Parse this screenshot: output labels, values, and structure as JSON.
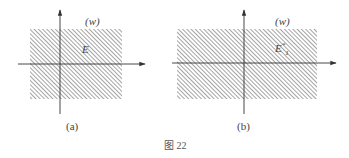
{
  "figure": {
    "caption": "图 22",
    "panels": [
      {
        "id": "a",
        "sublabel": "(a)",
        "plane_label": "(w)",
        "region_label": "E",
        "region": {
          "x": 30,
          "y": 29,
          "w": 92,
          "h": 70
        },
        "axes": {
          "origin_x": 60,
          "origin_y": 64,
          "h_start": 18,
          "h_end": 145,
          "v_top": 10,
          "v_bottom": 114
        }
      },
      {
        "id": "b",
        "sublabel": "(b)",
        "plane_label": "(w)",
        "region_label": "E",
        "region_label_sub": "1",
        "region_label_sup": "*",
        "region": {
          "x": 177,
          "y": 29,
          "w": 140,
          "h": 70
        },
        "axes": {
          "origin_x": 244,
          "origin_y": 63,
          "h_start": 172,
          "h_end": 336,
          "v_top": 10,
          "v_bottom": 114
        }
      }
    ],
    "colors": {
      "hatch": "#8a8a8a",
      "axis": "#333333",
      "background": "#ffffff"
    }
  }
}
